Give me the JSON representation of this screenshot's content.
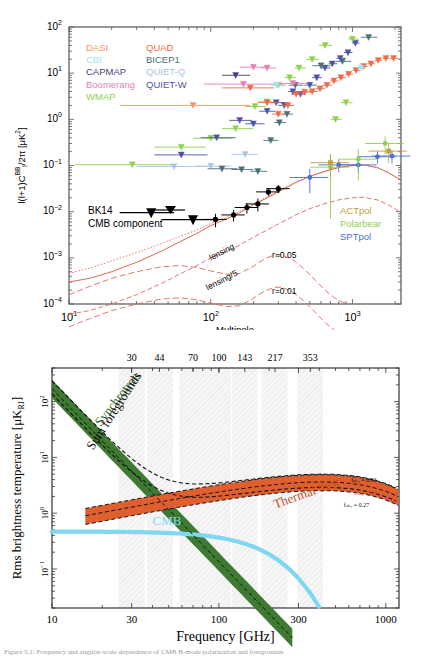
{
  "figure": {
    "caption": "Figure 5.1: Frequency and angular-scale dependence of CMB B-mode polarization and foregrounds"
  },
  "chart_data": [
    {
      "id": "bb-power-spectrum",
      "type": "scatter",
      "title": "",
      "xlabel": "Multipole",
      "ylabel": "l(l+1)Cₗᴮᴮ/2π [μK²]",
      "xscale": "log",
      "yscale": "log",
      "xlim": [
        10,
        2200
      ],
      "ylim": [
        0.0001,
        100
      ],
      "xticks": [
        "10¹",
        "10²",
        "10³"
      ],
      "yticks": [
        "10²",
        "10¹",
        "10⁰",
        "10⁻¹",
        "10⁻²",
        "10⁻³",
        "10⁻⁴"
      ],
      "grid": false,
      "legend_left": [
        {
          "label": "DASI",
          "color": "#f0976a"
        },
        {
          "label": "CBI",
          "color": "#9fe4ef"
        },
        {
          "label": "CAPMAP",
          "color": "#4a3d78"
        },
        {
          "label": "Boomerang",
          "color": "#e87fb5"
        },
        {
          "label": "WMAP",
          "color": "#8fd14a"
        }
      ],
      "legend_mid": [
        {
          "label": "QUAD",
          "color": "#ef6a4a"
        },
        {
          "label": "BICEP1",
          "color": "#4f6f76"
        },
        {
          "label": "QUIET-Q",
          "color": "#a8c4e8"
        },
        {
          "label": "QUIET-W",
          "color": "#4a53a8"
        }
      ],
      "legend_right": [
        {
          "label": "ACTpol",
          "color": "#bda23a"
        },
        {
          "label": "Polarbear",
          "color": "#8fd14a"
        },
        {
          "label": "SPTpol",
          "color": "#4a6fd4"
        }
      ],
      "dataset_label": {
        "line1": "BK14",
        "line2": "CMB component",
        "color": "#000000"
      },
      "curve_labels": [
        {
          "text": "lensing",
          "x": 120,
          "y": 0.0013
        },
        {
          "text": "lensing/5",
          "x": 120,
          "y": 0.00032
        },
        {
          "text": "r=0.05",
          "x": 330,
          "y": 0.0011
        },
        {
          "text": "r=0.01",
          "x": 330,
          "y": 0.00018
        }
      ],
      "series": [
        {
          "name": "BK14 CMB component",
          "color": "#000000",
          "marker": "circle",
          "points": [
            {
              "l": 38,
              "v": 0.0095,
              "upper_limit": true
            },
            {
              "l": 75,
              "v": 0.0067,
              "upper_limit": true
            },
            {
              "l": 108,
              "v": 0.0068,
              "err": 0.0022
            },
            {
              "l": 145,
              "v": 0.0085,
              "err": 0.0024
            },
            {
              "l": 180,
              "v": 0.0123,
              "err": 0.0032
            },
            {
              "l": 215,
              "v": 0.0147,
              "err": 0.0046
            },
            {
              "l": 255,
              "v": 0.0268,
              "err": 0.0051
            },
            {
              "l": 300,
              "v": 0.0315,
              "err": 0.0063
            }
          ]
        },
        {
          "name": "SPTpol",
          "color": "#4a6fd4",
          "marker": "circle",
          "points": [
            {
              "l": 500,
              "v": 0.055,
              "err": 0.03
            },
            {
              "l": 800,
              "v": 0.103,
              "err": 0.032
            },
            {
              "l": 1100,
              "v": 0.103,
              "err": 0.035
            },
            {
              "l": 1500,
              "v": 0.155,
              "err": 0.045
            },
            {
              "l": 1900,
              "v": 0.16,
              "err": 0.05
            }
          ]
        },
        {
          "name": "Polarbear",
          "color": "#8fd14a",
          "marker": "circle",
          "points": [
            {
              "l": 700,
              "v": 0.092,
              "err": 0.085
            },
            {
              "l": 1100,
              "v": 0.137,
              "err": 0.09
            },
            {
              "l": 1700,
              "v": 0.3,
              "err": 0.13
            }
          ]
        },
        {
          "name": "ACTpol",
          "color": "#bda23a",
          "marker": "square",
          "points": [
            {
              "l": 700,
              "v": 0.115,
              "err": 0.06
            },
            {
              "l": 1800,
              "v": 0.205,
              "err": 0.09
            }
          ]
        }
      ],
      "theory_curves": [
        {
          "name": "lensing",
          "style": "solid",
          "color": "#e46a5a"
        },
        {
          "name": "lensing/5",
          "style": "dashed",
          "color": "#e46a5a"
        },
        {
          "name": "r=0.05",
          "style": "dashed",
          "color": "#e46a5a"
        },
        {
          "name": "r=0.01",
          "style": "dashed",
          "color": "#e46a5a"
        },
        {
          "name": "total",
          "style": "dotted",
          "color": "#e46a5a"
        }
      ]
    },
    {
      "id": "foreground-brightness",
      "type": "line",
      "title": "",
      "xlabel": "Frequency [GHz]",
      "ylabel": "Rms brightness temperature [μKʀⱼ]",
      "xscale": "log",
      "yscale": "log",
      "xlim": [
        10,
        1200
      ],
      "ylim": [
        0.02,
        400
      ],
      "xticks": [
        "10",
        "30",
        "100",
        "300",
        "1000"
      ],
      "yticks": [
        "10²",
        "10¹",
        "10⁰",
        "10⁻¹"
      ],
      "band_labels": [
        "30",
        "44",
        "70",
        "100",
        "143",
        "217",
        "353"
      ],
      "band_centers": [
        30,
        44,
        70,
        100,
        143,
        217,
        353
      ],
      "components": [
        {
          "name": "Synchrotron",
          "color": "#3f7a33",
          "label_angle": -52
        },
        {
          "name": "Sum foregrounds",
          "color": "#111111",
          "label_angle": -57
        },
        {
          "name": "Thermal dust",
          "color": "#e05f2e",
          "label_angle": -20
        },
        {
          "name": "CMB",
          "color": "#7fd8ef",
          "label_angle": 0
        }
      ],
      "annotations": [
        {
          "text": "fₛₖᵧ = 0.83",
          "position": "dust-upper"
        },
        {
          "text": "fₛₖᵧ = 0.6",
          "position": "dust-middle"
        },
        {
          "text": "fₛₖᵧ = 0.27",
          "position": "dust-lower"
        }
      ]
    }
  ]
}
